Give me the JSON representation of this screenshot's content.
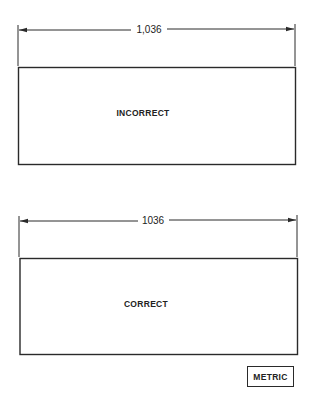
{
  "figures": [
    {
      "name": "incorrect",
      "dimension_label": "1,036",
      "box_label": "INCORRECT"
    },
    {
      "name": "correct",
      "dimension_label": "1036",
      "box_label": "CORRECT"
    }
  ],
  "units_badge": "METRIC",
  "colors": {
    "line": "#2a2a2a",
    "background": "#ffffff"
  }
}
